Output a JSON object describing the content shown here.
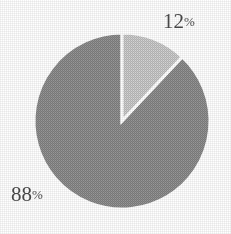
{
  "chart_data": {
    "type": "pie",
    "title": "",
    "subtitle": "",
    "xlabel": "",
    "ylabel": "",
    "legend_position": "none",
    "grid": false,
    "categories": [
      "12%",
      "88%"
    ],
    "values": [
      12,
      88
    ],
    "labels": [
      "12%",
      "88%"
    ],
    "slices": [
      {
        "label": "12%",
        "value": 12,
        "number": "12",
        "unit": "%",
        "color": "#c9c9c9",
        "start_angle_deg": 0,
        "end_angle_deg": 43.2
      },
      {
        "label": "88%",
        "value": 88,
        "number": "88",
        "unit": "%",
        "color": "#8c8c8c",
        "start_angle_deg": 43.2,
        "end_angle_deg": 360
      }
    ],
    "geometry": {
      "center_x": 122,
      "center_y": 121,
      "radius": 88,
      "start_angle_deg": 0,
      "direction": "clockwise"
    },
    "colors": {
      "background": "#ffffff",
      "separator": "#ffffff",
      "label_text": "#2b2b2b",
      "slice_light": "#c9c9c9",
      "slice_dark": "#8c8c8c"
    }
  }
}
